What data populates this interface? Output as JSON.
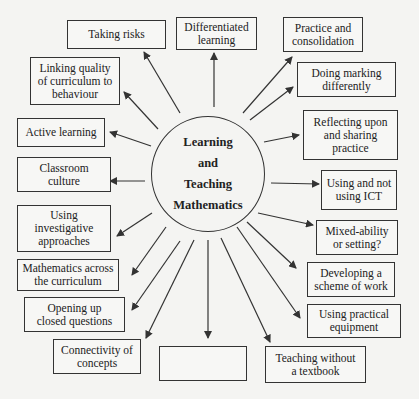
{
  "center": {
    "lines": [
      "Learning",
      "and",
      "Teaching",
      "Mathematics"
    ]
  },
  "nodes": [
    {
      "id": "taking-risks",
      "lines": [
        "Taking risks"
      ],
      "x": 67,
      "y": 20,
      "w": 99,
      "h": 29
    },
    {
      "id": "differentiated-learning",
      "lines": [
        "Differentiated",
        "learning"
      ],
      "x": 176,
      "y": 17,
      "w": 81,
      "h": 33
    },
    {
      "id": "practice-consolidation",
      "lines": [
        "Practice and",
        "consolidation"
      ],
      "x": 283,
      "y": 17,
      "w": 80,
      "h": 35
    },
    {
      "id": "doing-marking",
      "lines": [
        "Doing marking",
        "differently"
      ],
      "x": 297,
      "y": 62,
      "w": 99,
      "h": 35
    },
    {
      "id": "linking-quality",
      "lines": [
        "Linking quality",
        "of curriculum to",
        "behaviour"
      ],
      "x": 30,
      "y": 57,
      "w": 90,
      "h": 48
    },
    {
      "id": "reflecting",
      "lines": [
        "Reflecting upon",
        "and sharing",
        "practice"
      ],
      "x": 303,
      "y": 110,
      "w": 95,
      "h": 50
    },
    {
      "id": "active-learning",
      "lines": [
        "Active learning"
      ],
      "x": 17,
      "y": 118,
      "w": 88,
      "h": 29
    },
    {
      "id": "using-ict",
      "lines": [
        "Using and not",
        "using ICT"
      ],
      "x": 321,
      "y": 170,
      "w": 76,
      "h": 40
    },
    {
      "id": "classroom-culture",
      "lines": [
        "Classroom",
        "culture"
      ],
      "x": 17,
      "y": 157,
      "w": 94,
      "h": 35
    },
    {
      "id": "mixed-ability",
      "lines": [
        "Mixed-ability",
        "or setting?"
      ],
      "x": 316,
      "y": 220,
      "w": 82,
      "h": 35
    },
    {
      "id": "investigative",
      "lines": [
        "Using",
        "investigative",
        "approaches"
      ],
      "x": 17,
      "y": 205,
      "w": 94,
      "h": 47
    },
    {
      "id": "scheme-of-work",
      "lines": [
        "Developing a",
        "scheme of work"
      ],
      "x": 307,
      "y": 262,
      "w": 88,
      "h": 35
    },
    {
      "id": "maths-across",
      "lines": [
        "Mathematics across",
        "the curriculum"
      ],
      "x": 17,
      "y": 259,
      "w": 102,
      "h": 32
    },
    {
      "id": "practical-equipment",
      "lines": [
        "Using practical",
        "equipment"
      ],
      "x": 307,
      "y": 304,
      "w": 94,
      "h": 34
    },
    {
      "id": "opening-up",
      "lines": [
        "Opening up",
        "closed questions"
      ],
      "x": 24,
      "y": 297,
      "w": 101,
      "h": 35
    },
    {
      "id": "connectivity",
      "lines": [
        "Connectivity of",
        "concepts"
      ],
      "x": 53,
      "y": 339,
      "w": 88,
      "h": 35
    },
    {
      "id": "empty-box",
      "lines": [
        ""
      ],
      "x": 159,
      "y": 346,
      "w": 88,
      "h": 35
    },
    {
      "id": "teaching-without-textbook",
      "lines": [
        "Teaching without",
        "a textbook"
      ],
      "x": 265,
      "y": 346,
      "w": 101,
      "h": 37
    }
  ],
  "arrows": [
    {
      "to": "taking-risks",
      "x1": 180,
      "y1": 113,
      "x2": 144,
      "y2": 52
    },
    {
      "to": "differentiated-learning",
      "x1": 214,
      "y1": 107,
      "x2": 214,
      "y2": 53
    },
    {
      "to": "practice-consolidation",
      "x1": 243,
      "y1": 113,
      "x2": 292,
      "y2": 57
    },
    {
      "to": "doing-marking",
      "x1": 250,
      "y1": 120,
      "x2": 293,
      "y2": 87
    },
    {
      "to": "linking-quality",
      "x1": 158,
      "y1": 129,
      "x2": 124,
      "y2": 92
    },
    {
      "to": "reflecting",
      "x1": 264,
      "y1": 142,
      "x2": 299,
      "y2": 135
    },
    {
      "to": "active-learning",
      "x1": 151,
      "y1": 146,
      "x2": 110,
      "y2": 132
    },
    {
      "to": "using-ict",
      "x1": 271,
      "y1": 183,
      "x2": 319,
      "y2": 184
    },
    {
      "to": "classroom-culture",
      "x1": 145,
      "y1": 181,
      "x2": 110,
      "y2": 181
    },
    {
      "to": "mixed-ability",
      "x1": 258,
      "y1": 213,
      "x2": 313,
      "y2": 225
    },
    {
      "to": "investigative",
      "x1": 152,
      "y1": 213,
      "x2": 117,
      "y2": 236
    },
    {
      "to": "scheme-of-work",
      "x1": 247,
      "y1": 222,
      "x2": 296,
      "y2": 268
    },
    {
      "to": "maths-across",
      "x1": 166,
      "y1": 227,
      "x2": 132,
      "y2": 275
    },
    {
      "to": "practical-equipment",
      "x1": 237,
      "y1": 227,
      "x2": 300,
      "y2": 318
    },
    {
      "to": "opening-up",
      "x1": 180,
      "y1": 241,
      "x2": 132,
      "y2": 310
    },
    {
      "to": "connectivity",
      "x1": 194,
      "y1": 240,
      "x2": 146,
      "y2": 338
    },
    {
      "to": "empty-box",
      "x1": 208,
      "y1": 240,
      "x2": 208,
      "y2": 338
    },
    {
      "to": "teaching-without-textbook",
      "x1": 221,
      "y1": 238,
      "x2": 270,
      "y2": 342
    }
  ],
  "colors": {
    "line": "#333333",
    "background": "#f4f4f2"
  }
}
